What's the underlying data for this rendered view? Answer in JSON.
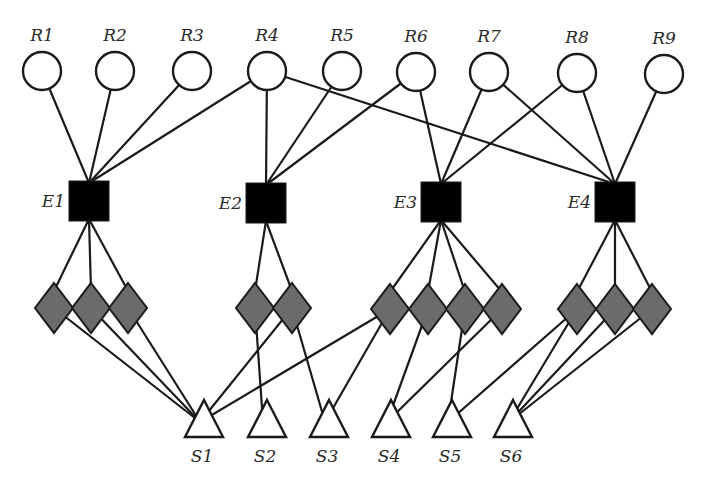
{
  "diagram": {
    "colors": {
      "edge": "#1a1a1a",
      "resource_fill": "#ffffff",
      "entity_fill": "#000000",
      "diamond_fill": "#6b6b6b",
      "sink_fill": "#ffffff",
      "label": "#2a2a2a"
    },
    "resources": [
      {
        "id": "R1",
        "label": "R1",
        "x": 42,
        "y": 71
      },
      {
        "id": "R2",
        "label": "R2",
        "x": 115,
        "y": 71
      },
      {
        "id": "R3",
        "label": "R3",
        "x": 192,
        "y": 71
      },
      {
        "id": "R4",
        "label": "R4",
        "x": 267,
        "y": 71
      },
      {
        "id": "R5",
        "label": "R5",
        "x": 342,
        "y": 71
      },
      {
        "id": "R6",
        "label": "R6",
        "x": 416,
        "y": 72
      },
      {
        "id": "R7",
        "label": "R7",
        "x": 489,
        "y": 72
      },
      {
        "id": "R8",
        "label": "R8",
        "x": 577,
        "y": 73
      },
      {
        "id": "R9",
        "label": "R9",
        "x": 664,
        "y": 74
      }
    ],
    "entities": [
      {
        "id": "E1",
        "label": "E1",
        "x": 89,
        "y": 201
      },
      {
        "id": "E2",
        "label": "E2",
        "x": 266,
        "y": 203
      },
      {
        "id": "E3",
        "label": "E3",
        "x": 441,
        "y": 202
      },
      {
        "id": "E4",
        "label": "E4",
        "x": 615,
        "y": 202
      }
    ],
    "diamonds": [
      {
        "id": "E1-D1",
        "parent": "E1",
        "x": 54,
        "y": 308
      },
      {
        "id": "E1-D2",
        "parent": "E1",
        "x": 91,
        "y": 308
      },
      {
        "id": "E1-D3",
        "parent": "E1",
        "x": 128,
        "y": 308
      },
      {
        "id": "E2-D1",
        "parent": "E2",
        "x": 255,
        "y": 308
      },
      {
        "id": "E2-D2",
        "parent": "E2",
        "x": 292,
        "y": 308
      },
      {
        "id": "E3-D1",
        "parent": "E3",
        "x": 390,
        "y": 309
      },
      {
        "id": "E3-D2",
        "parent": "E3",
        "x": 428,
        "y": 309
      },
      {
        "id": "E3-D3",
        "parent": "E3",
        "x": 465,
        "y": 309
      },
      {
        "id": "E3-D4",
        "parent": "E3",
        "x": 502,
        "y": 309
      },
      {
        "id": "E4-D1",
        "parent": "E4",
        "x": 577,
        "y": 309
      },
      {
        "id": "E4-D2",
        "parent": "E4",
        "x": 615,
        "y": 309
      },
      {
        "id": "E4-D3",
        "parent": "E4",
        "x": 652,
        "y": 309
      }
    ],
    "sinks": [
      {
        "id": "S1",
        "label": "S1",
        "x": 204,
        "y": 420
      },
      {
        "id": "S2",
        "label": "S2",
        "x": 267,
        "y": 420
      },
      {
        "id": "S3",
        "label": "S3",
        "x": 329,
        "y": 420
      },
      {
        "id": "S4",
        "label": "S4",
        "x": 391,
        "y": 420
      },
      {
        "id": "S5",
        "label": "S5",
        "x": 452,
        "y": 420
      },
      {
        "id": "S6",
        "label": "S6",
        "x": 513,
        "y": 420
      }
    ],
    "resource_entity_edges": [
      [
        "R1",
        "E1"
      ],
      [
        "R2",
        "E1"
      ],
      [
        "R3",
        "E1"
      ],
      [
        "R4",
        "E1"
      ],
      [
        "R4",
        "E2"
      ],
      [
        "R4",
        "E4"
      ],
      [
        "R5",
        "E2"
      ],
      [
        "R6",
        "E2"
      ],
      [
        "R6",
        "E3"
      ],
      [
        "R7",
        "E3"
      ],
      [
        "R7",
        "E4"
      ],
      [
        "R8",
        "E3"
      ],
      [
        "R8",
        "E4"
      ],
      [
        "R9",
        "E4"
      ]
    ],
    "diamond_sink_edges": [
      [
        "E1-D1",
        "S1"
      ],
      [
        "E1-D2",
        "S1"
      ],
      [
        "E1-D3",
        "S1"
      ],
      [
        "E2-D1",
        "S2"
      ],
      [
        "E2-D2",
        "S1"
      ],
      [
        "E2-D2",
        "S3"
      ],
      [
        "E3-D1",
        "S1"
      ],
      [
        "E3-D1",
        "S3"
      ],
      [
        "E3-D2",
        "S4"
      ],
      [
        "E3-D3",
        "S5"
      ],
      [
        "E3-D4",
        "S4"
      ],
      [
        "E4-D1",
        "S5"
      ],
      [
        "E4-D1",
        "S6"
      ],
      [
        "E4-D2",
        "S6"
      ],
      [
        "E4-D3",
        "S6"
      ]
    ]
  }
}
